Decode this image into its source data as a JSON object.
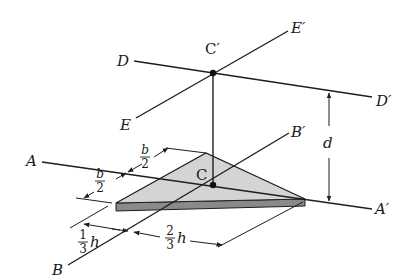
{
  "figure": {
    "type": "isometric moment-of-inertia diagram (triangular plate with parallel axes)",
    "points": {
      "C": "C",
      "C_prime": "C′"
    },
    "axes": {
      "A": "A",
      "A_prime": "A′",
      "B": "B",
      "B_prime": "B′",
      "D": "D",
      "D_prime": "D′",
      "E": "E",
      "E_prime": "E′"
    },
    "dimensions": {
      "d": "d",
      "b_half_top": {
        "num": "b",
        "den": "2"
      },
      "b_half_bottom": {
        "num": "b",
        "den": "2"
      },
      "h_third": {
        "num": "1",
        "den": "3",
        "var": "h"
      },
      "h_two_thirds": {
        "num": "2",
        "den": "3",
        "var": "h"
      }
    },
    "colors": {
      "plate_top": "#d4d4d4",
      "plate_edge": "#8a8a8a",
      "lines": "#1e1e1e",
      "background": "#ffffff"
    }
  }
}
